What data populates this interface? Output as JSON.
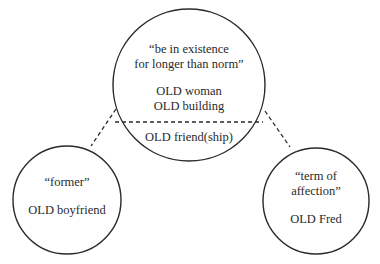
{
  "diagram": {
    "type": "polysemy-network",
    "central_node": {
      "gloss_lines": [
        "“be in existence",
        "for longer than norm”"
      ],
      "examples": [
        "OLD woman",
        "OLD building"
      ],
      "lower_segment_example": "OLD friend(ship)"
    },
    "left_node": {
      "gloss": "“former”",
      "example": "OLD boyfriend"
    },
    "right_node": {
      "gloss_lines": [
        "“term of",
        "affection”"
      ],
      "example": "OLD Fred"
    },
    "edges": [
      {
        "from": "central_node.lower_segment",
        "to": "left_node",
        "style": "dashed"
      },
      {
        "from": "central_node.lower_segment",
        "to": "right_node",
        "style": "dashed"
      }
    ],
    "colors": {
      "stroke": "#2a2a2a",
      "background": "#ffffff"
    }
  }
}
